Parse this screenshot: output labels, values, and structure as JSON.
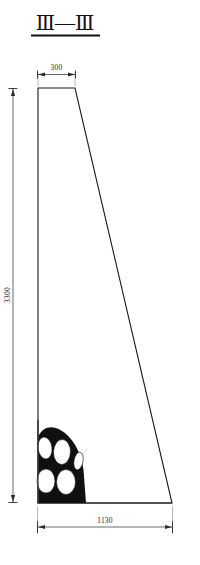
{
  "title": {
    "label": "Ⅲ—Ⅲ",
    "underline": true
  },
  "drawing": {
    "kind": "engineering-cross-section",
    "description": "Trapezoidal retaining wall cross-section with drainage pipe bundle at base",
    "colors": {
      "outline": "#1a1a1a",
      "fill_mass": "#101010",
      "void": "#ffffff",
      "dimension": "#2b2b2b",
      "extension": "#8a8a8a",
      "background": "#ffffff"
    }
  },
  "dimensions": {
    "top_width": {
      "value": "300",
      "position": "top",
      "unit_implied": "mm"
    },
    "bottom_width": {
      "value": "1130",
      "position": "bottom",
      "unit_implied": "mm"
    },
    "height": {
      "value": "3300",
      "position": "left",
      "orientation": "vertical",
      "unit_implied": "mm"
    }
  },
  "section_shape": {
    "type": "trapezoid",
    "top_left_px": [
      38,
      88
    ],
    "top_right_px": [
      75,
      88
    ],
    "bottom_right_px": [
      172,
      503
    ],
    "bottom_left_px": [
      38,
      503
    ]
  },
  "pipe_bundle": {
    "count": 5,
    "fill": "solid-black",
    "voids": [
      {
        "cx": 45,
        "cy": 448,
        "rx": 7.0,
        "ry": 11.0,
        "rot": -8
      },
      {
        "cx": 62,
        "cy": 452,
        "rx": 8.5,
        "ry": 12.5,
        "rot": 2
      },
      {
        "cx": 46,
        "cy": 481,
        "rx": 9.0,
        "ry": 12.0,
        "rot": 0
      },
      {
        "cx": 66,
        "cy": 482,
        "rx": 9.5,
        "ry": 12.5,
        "rot": 0
      },
      {
        "cx": 78,
        "cy": 461,
        "rx": 4.5,
        "ry": 9.0,
        "rot": 10
      }
    ]
  }
}
